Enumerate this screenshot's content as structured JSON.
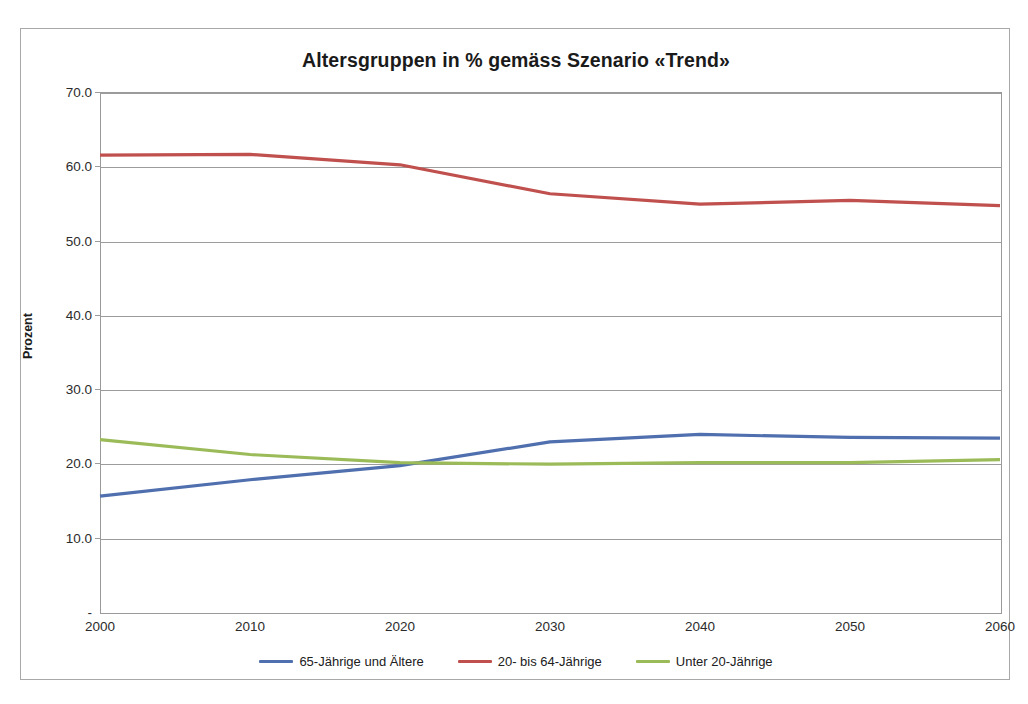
{
  "caption": {
    "top_text_left": "",
    "top_text_right": ""
  },
  "chart": {
    "title": "Altersgruppen in % gemäss Szenario «Trend»",
    "axis_title_y": "Prozent",
    "zero_tick_label": "-"
  },
  "colors": {
    "series_65_plus": "#4F6FAE",
    "series_20_64": "#C0504D",
    "series_under_20": "#9BBB59",
    "gridline": "#9C9C9C",
    "frame": "#A8A8A8",
    "text": "#202020"
  },
  "chart_data": {
    "type": "line",
    "title": "Altersgruppen in % gemäss Szenario «Trend»",
    "xlabel": "",
    "ylabel": "Prozent",
    "x": [
      2000,
      2010,
      2020,
      2030,
      2040,
      2050,
      2060
    ],
    "xticklabels": [
      "2000",
      "2010",
      "2020",
      "2030",
      "2040",
      "2050",
      "2060"
    ],
    "yticklabels": [
      "-",
      "10.0",
      "20.0",
      "30.0",
      "40.0",
      "50.0",
      "60.0",
      "70.0"
    ],
    "ylim": [
      0,
      70
    ],
    "ytick_step": 10,
    "grid": "horizontal",
    "legend_position": "bottom",
    "series": [
      {
        "name": "65-Jährige und Ältere",
        "color": "#4F6FAE",
        "values": [
          15.6,
          17.8,
          19.7,
          22.9,
          23.9,
          23.5,
          23.4
        ]
      },
      {
        "name": "20- bis 64-Jährige",
        "color": "#C0504D",
        "values": [
          61.5,
          61.6,
          60.2,
          56.3,
          54.9,
          55.4,
          54.7
        ]
      },
      {
        "name": "Unter 20-Jährige",
        "color": "#9BBB59",
        "values": [
          23.2,
          21.2,
          20.1,
          19.9,
          20.1,
          20.1,
          20.5
        ]
      }
    ]
  },
  "legend": [
    {
      "label": "65-Jährige und Ältere",
      "color": "#4F6FAE"
    },
    {
      "label": "20- bis 64-Jährige",
      "color": "#C0504D"
    },
    {
      "label": "Unter 20-Jährige",
      "color": "#9BBB59"
    }
  ]
}
